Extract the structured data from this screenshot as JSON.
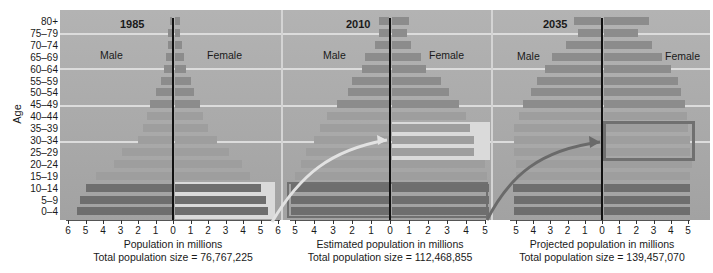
{
  "chart_data": [
    {
      "type": "bar",
      "orientation": "horizontal-pyramid",
      "title": "1985",
      "xlabel": "Population in millions",
      "subtitle": "Total population size = 76,767,225",
      "ylabel": "Age",
      "categories": [
        "0–4",
        "5–9",
        "10–14",
        "15–19",
        "20–24",
        "25–29",
        "30–34",
        "35–39",
        "40–44",
        "45–49",
        "50–54",
        "55–59",
        "60–64",
        "65–69",
        "70–74",
        "75–79",
        "80+"
      ],
      "x_ticks_left": [
        "6",
        "5",
        "4",
        "3",
        "2",
        "1",
        "0"
      ],
      "x_ticks_right": [
        "1",
        "2",
        "3",
        "4",
        "5",
        "6"
      ],
      "xlim": [
        -6,
        6
      ],
      "series": [
        {
          "name": "Male",
          "values": [
            5.5,
            5.3,
            5.0,
            4.4,
            3.4,
            2.9,
            2.0,
            1.7,
            1.5,
            1.3,
            1.0,
            0.7,
            0.5,
            0.4,
            0.3,
            0.3,
            0.2
          ]
        },
        {
          "name": "Female",
          "values": [
            5.3,
            5.2,
            4.9,
            4.3,
            3.8,
            3.1,
            2.4,
            1.9,
            1.6,
            1.4,
            1.1,
            0.9,
            0.6,
            0.5,
            0.4,
            0.3,
            0.3
          ]
        }
      ]
    },
    {
      "type": "bar",
      "orientation": "horizontal-pyramid",
      "title": "2010",
      "xlabel": "Estimated population in millions",
      "subtitle": "Total population size = 112,468,855",
      "categories": [
        "0–4",
        "5–9",
        "10–14",
        "15–19",
        "20–24",
        "25–29",
        "30–34",
        "35–39",
        "40–44",
        "45–49",
        "50–54",
        "55–59",
        "60–64",
        "65–69",
        "70–74",
        "75–79",
        "80+"
      ],
      "x_ticks_left": [
        "5",
        "4",
        "3",
        "2",
        "1",
        "0"
      ],
      "x_ticks_right": [
        "1",
        "2",
        "3",
        "4",
        "5"
      ],
      "xlim": [
        -5.5,
        5.5
      ],
      "series": [
        {
          "name": "Male",
          "values": [
            5.2,
            5.2,
            5.2,
            5.0,
            4.7,
            4.4,
            4.0,
            3.7,
            3.3,
            2.8,
            2.2,
            2.0,
            1.5,
            1.3,
            0.8,
            0.6,
            0.6
          ]
        },
        {
          "name": "Female",
          "values": [
            5.1,
            5.1,
            5.1,
            5.0,
            4.9,
            4.3,
            4.3,
            4.1,
            3.9,
            3.5,
            3.0,
            2.6,
            1.8,
            1.5,
            1.0,
            0.8,
            0.9
          ]
        }
      ]
    },
    {
      "type": "bar",
      "orientation": "horizontal-pyramid",
      "title": "2035",
      "xlabel": "Projected population in millions",
      "subtitle": "Total population size = 139,457,070",
      "categories": [
        "0–4",
        "5–9",
        "10–14",
        "15–19",
        "20–24",
        "25–29",
        "30–34",
        "35–39",
        "40–44",
        "45–49",
        "50–54",
        "55–59",
        "60–64",
        "65–69",
        "70–74",
        "75–79",
        "80+"
      ],
      "x_ticks_left": [
        "5",
        "4",
        "3",
        "2",
        "1",
        "0"
      ],
      "x_ticks_right": [
        "1",
        "2",
        "3",
        "4",
        "5"
      ],
      "xlim": [
        -5.5,
        5.5
      ],
      "series": [
        {
          "name": "Male",
          "values": [
            5.1,
            5.1,
            5.2,
            5.0,
            5.0,
            5.1,
            5.1,
            5.1,
            4.8,
            4.6,
            4.1,
            3.8,
            3.3,
            2.9,
            2.1,
            1.4,
            1.6
          ]
        },
        {
          "name": "Female",
          "values": [
            5.0,
            5.0,
            5.0,
            5.0,
            5.1,
            5.0,
            5.0,
            4.9,
            4.8,
            4.7,
            4.5,
            4.3,
            3.9,
            3.4,
            2.8,
            2.0,
            2.6
          ]
        }
      ]
    }
  ],
  "labels": {
    "ylabel": "Age",
    "male": "Male",
    "female": "Female",
    "p1": {
      "year": "1985",
      "xtitle": "Population in millions",
      "total": "Total population size = 76,767,225"
    },
    "p2": {
      "year": "2010",
      "xtitle": "Estimated population in millions",
      "total": "Total population size = 112,468,855"
    },
    "p3": {
      "year": "2035",
      "xtitle": "Projected population in millions",
      "total": "Total population size = 139,457,070"
    }
  },
  "colors": {
    "background": "#ababab",
    "bar_dark": "#6e6e6e",
    "bar_mid": "#8c8c8c",
    "bar_light": "#9e9e9e",
    "highlight_light": "#dadada",
    "highlight_box": "#707070",
    "arrow_light": "#e0e0e0",
    "arrow_dark": "#6a6a6a",
    "gridline": "#dcdcdc"
  }
}
